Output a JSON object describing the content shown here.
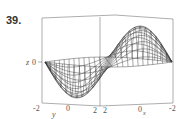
{
  "figure": {
    "number": "39."
  },
  "chart_data": {
    "type": "surface3d",
    "title": "",
    "axes": {
      "x": {
        "label": "x",
        "ticks": [
          "2",
          "0",
          "-2"
        ],
        "range": [
          -2,
          2
        ]
      },
      "y": {
        "label": "y",
        "ticks": [
          "-2",
          "0",
          "2"
        ],
        "range": [
          -2,
          2
        ]
      },
      "z": {
        "label": "z",
        "ticks": [
          "0"
        ]
      }
    },
    "grid": "wireframe mesh",
    "box": true
  },
  "labels": {
    "z_axis": "z",
    "z_tick": "0",
    "y_axis": "y",
    "y_tick_left": "-2",
    "y_tick_mid": "0",
    "y_tick_right": "2",
    "x_axis": "x",
    "x_tick_left": "2",
    "x_tick_mid": "0",
    "x_tick_right": "-2"
  },
  "colors": {
    "mesh": "#3a3a3a",
    "box": "#777777"
  }
}
